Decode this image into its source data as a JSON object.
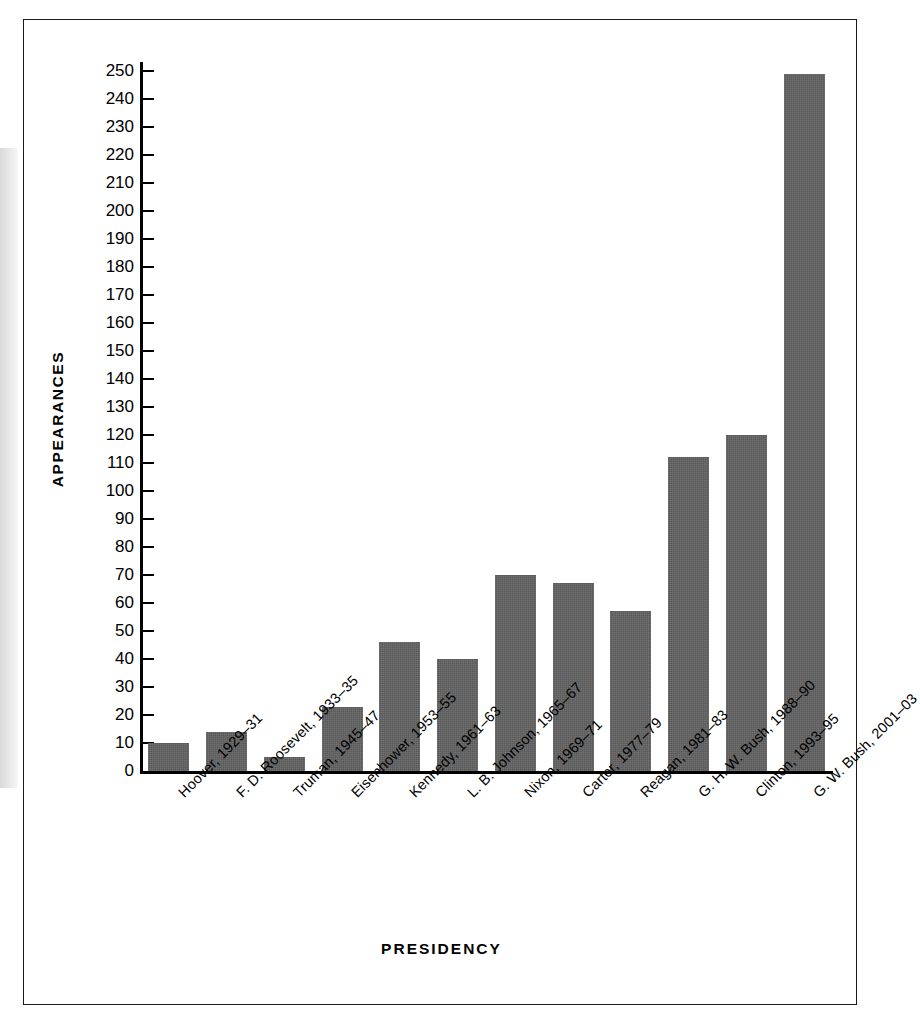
{
  "figure": {
    "border_color": "#1a1a1a",
    "background": "#ffffff"
  },
  "chart_data": {
    "type": "bar",
    "title": "",
    "xlabel": "PRESIDENCY",
    "ylabel": "APPEARANCES",
    "categories": [
      "Hoover, 1929–31",
      "F. D. Roosevelt, 1933–35",
      "Truman, 1945–47",
      "Eisenhower, 1953–55",
      "Kennedy, 1961–63",
      "L. B. Johnson, 1965–67",
      "Nixon, 1969–71",
      "Carter, 1977–79",
      "Reagan, 1981–83",
      "G. H. W. Bush, 1988–90",
      "Clinton, 1993–95",
      "G. W. Bush, 2001–03"
    ],
    "values": [
      10,
      14,
      5,
      23,
      46,
      40,
      70,
      67,
      57,
      112,
      120,
      249
    ],
    "ylim": [
      0,
      250
    ],
    "ytick_step": 10,
    "yticks": [
      0,
      10,
      20,
      30,
      40,
      50,
      60,
      70,
      80,
      90,
      100,
      110,
      120,
      130,
      140,
      150,
      160,
      170,
      180,
      190,
      200,
      210,
      220,
      230,
      240,
      250
    ],
    "bar_color": "#595959",
    "grid": false,
    "legend": null,
    "label_rotation_deg": -45
  }
}
